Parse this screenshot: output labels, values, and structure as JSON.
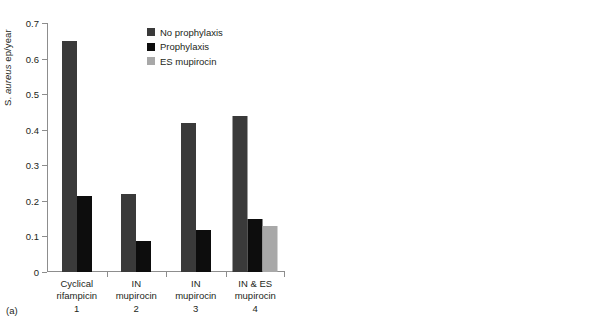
{
  "figure": {
    "background": "#ffffff",
    "colors": {
      "no_prophylaxis": "#3a3a3a",
      "prophylaxis": "#0d0d0d",
      "es_mupirocin": "#a8a8a8",
      "control": "#3a3a3a",
      "axis": "#8d8d8d",
      "text": "#231f20"
    }
  },
  "panel_a": {
    "tag": "(a)",
    "legend": [
      {
        "label": "No prophylaxis",
        "color": "#3a3a3a"
      },
      {
        "label": "Prophylaxis",
        "color": "#0d0d0d"
      },
      {
        "label": "ES mupirocin",
        "color": "#a8a8a8"
      }
    ],
    "yticks": [
      "0",
      "0.1",
      "0.2",
      "0.3",
      "0.4",
      "0.5",
      "0.6",
      "0.7"
    ],
    "xlabels": [
      {
        "line1": "Cyclical",
        "line2": "rifampicin",
        "line3": "1"
      },
      {
        "line1": "IN",
        "line2": "mupirocin",
        "line3": "2"
      },
      {
        "line1": "IN",
        "line2": "mupirocin",
        "line3": "3"
      },
      {
        "line1": "IN & ES",
        "line2": "mupirocin",
        "line3": "4"
      }
    ]
  },
  "panel_b": {
    "tag": "(b)",
    "legend": [
      {
        "label": "Control",
        "color": "#3a3a3a"
      },
      {
        "label": "Prophylaxis",
        "color": "#0d0d0d"
      }
    ],
    "yticks": [
      "0",
      "0.05",
      "0.1",
      "0.15",
      "0.2",
      "0.25"
    ],
    "xlabels": [
      {
        "line1": "IN",
        "line2": "mupirocin",
        "line3": "5"
      },
      {
        "line1": "IN",
        "line2": "mupirocin",
        "line3": "6"
      },
      {
        "line1": "ES",
        "line2": "mupirocin",
        "line3": "7"
      },
      {
        "line1": "ES",
        "line2": "mupirocin",
        "line3": "8"
      }
    ]
  },
  "chart_data": [
    {
      "type": "bar",
      "panel": "(a)",
      "title": "",
      "xlabel": "",
      "ylabel": "S. aureus ep/year",
      "ylim": [
        0,
        0.7
      ],
      "ytick_values": [
        0,
        0.1,
        0.2,
        0.3,
        0.4,
        0.5,
        0.6,
        0.7
      ],
      "grid": false,
      "legend_position": "top-center",
      "categories": [
        "Cyclical rifampicin 1",
        "IN mupirocin 2",
        "IN mupirocin 3",
        "IN & ES mupirocin 4"
      ],
      "series": [
        {
          "name": "No prophylaxis",
          "color": "#3a3a3a",
          "values": [
            0.65,
            0.218,
            0.42,
            0.44
          ]
        },
        {
          "name": "Prophylaxis",
          "color": "#0d0d0d",
          "values": [
            0.215,
            0.088,
            0.118,
            0.15
          ]
        },
        {
          "name": "ES mupirocin",
          "color": "#a8a8a8",
          "values": [
            null,
            null,
            null,
            0.13
          ]
        }
      ]
    },
    {
      "type": "bar",
      "panel": "(b)",
      "title": "",
      "xlabel": "",
      "ylabel": "",
      "ylim": [
        0,
        0.25
      ],
      "ytick_values": [
        0,
        0.05,
        0.1,
        0.15,
        0.2,
        0.25
      ],
      "grid": false,
      "legend_position": "top-right",
      "categories": [
        "IN mupirocin 5",
        "IN mupirocin 6",
        "ES mupirocin 7",
        "ES mupirocin 8"
      ],
      "series": [
        {
          "name": "Control",
          "color": "#3a3a3a",
          "values": [
            0.204,
            0.224,
            0.155,
            0.155
          ]
        },
        {
          "name": "Prophylaxis",
          "color": "#0d0d0d",
          "values": [
            0.019,
            0.15,
            0.038,
            0.057
          ]
        }
      ]
    }
  ]
}
